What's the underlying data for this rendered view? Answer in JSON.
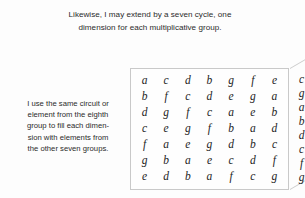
{
  "heading": {
    "lines": [
      "Likewise, I may extend by a seven cycle, one",
      "dimension for each multiplicative group."
    ]
  },
  "left_note": {
    "lines": [
      "I use the same circuit or",
      "element from the eighth",
      "group to fill each dimen-",
      "sion with elements from",
      "the other seven groups."
    ]
  },
  "figure": {
    "front_face": {
      "rows": [
        [
          "a",
          "c",
          "d",
          "b",
          "g",
          "f",
          "e"
        ],
        [
          "b",
          "f",
          "c",
          "d",
          "e",
          "g",
          "a"
        ],
        [
          "d",
          "g",
          "f",
          "c",
          "a",
          "e",
          "b"
        ],
        [
          "c",
          "e",
          "g",
          "f",
          "b",
          "a",
          "d"
        ],
        [
          "f",
          "a",
          "e",
          "g",
          "d",
          "b",
          "c"
        ],
        [
          "g",
          "b",
          "a",
          "e",
          "c",
          "d",
          "f"
        ],
        [
          "e",
          "d",
          "b",
          "a",
          "f",
          "c",
          "g"
        ]
      ]
    },
    "side_face": {
      "rows": [
        [
          "c",
          "f",
          "d",
          ""
        ],
        [
          "g",
          "c",
          "c",
          "f"
        ],
        [
          "a",
          "f",
          "g",
          "c"
        ],
        [
          "b",
          "e",
          "e",
          "g"
        ],
        [
          "d",
          "b",
          "g",
          "e"
        ],
        [
          "c",
          "d",
          "a",
          "a"
        ],
        [
          "f",
          "c",
          "e",
          "b"
        ],
        [
          "g",
          "f",
          "d",
          "d"
        ]
      ]
    }
  },
  "colors": {
    "text": "#2b2b2b",
    "letters": "#1d1d1d",
    "border": "#c9c9c9",
    "background": "#fdfdfd"
  }
}
